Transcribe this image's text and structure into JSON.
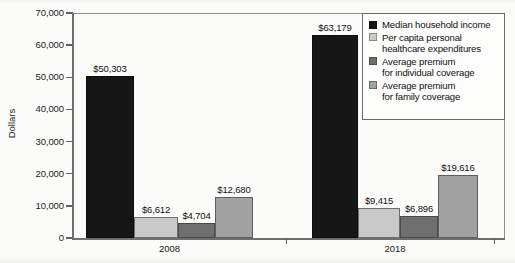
{
  "chart_data": {
    "type": "bar",
    "title": "",
    "xlabel": "",
    "ylabel": "Dollars",
    "ylim": [
      0,
      70000
    ],
    "ytick_labels": [
      "70,000",
      "60,000",
      "50,000",
      "40,000",
      "30,000",
      "20,000",
      "10,000",
      "0"
    ],
    "ytick_values": [
      70000,
      60000,
      50000,
      40000,
      30000,
      20000,
      10000,
      0
    ],
    "grid": false,
    "legend_position": "top-right",
    "categories": [
      "2008",
      "2018"
    ],
    "series": [
      {
        "name": "Median household income",
        "color": "#161616",
        "values": [
          50303,
          63179
        ],
        "labels": [
          "$50,303",
          "$63,179"
        ]
      },
      {
        "name": "Per capita personal healthcare expenditures",
        "color": "#c9c9c9",
        "values": [
          6612,
          9415
        ],
        "labels": [
          "$6,612",
          "$9,415"
        ]
      },
      {
        "name": "Average premium for individual coverage",
        "color": "#6f6f6f",
        "values": [
          4704,
          6896
        ],
        "labels": [
          "$4,704",
          "$6,896"
        ]
      },
      {
        "name": "Average premium for family coverage",
        "color": "#a2a2a2",
        "values": [
          12680,
          19616
        ],
        "labels": [
          "$12,680",
          "$19,616"
        ]
      }
    ]
  },
  "legend": {
    "entries": [
      {
        "line1": "Median household income",
        "line2": ""
      },
      {
        "line1": "Per capita personal",
        "line2": "healthcare expenditures"
      },
      {
        "line1": "Average premium",
        "line2": "for individual coverage"
      },
      {
        "line1": "Average premium",
        "line2": "for family coverage"
      }
    ]
  },
  "axis": {
    "y_title": "Dollars"
  }
}
